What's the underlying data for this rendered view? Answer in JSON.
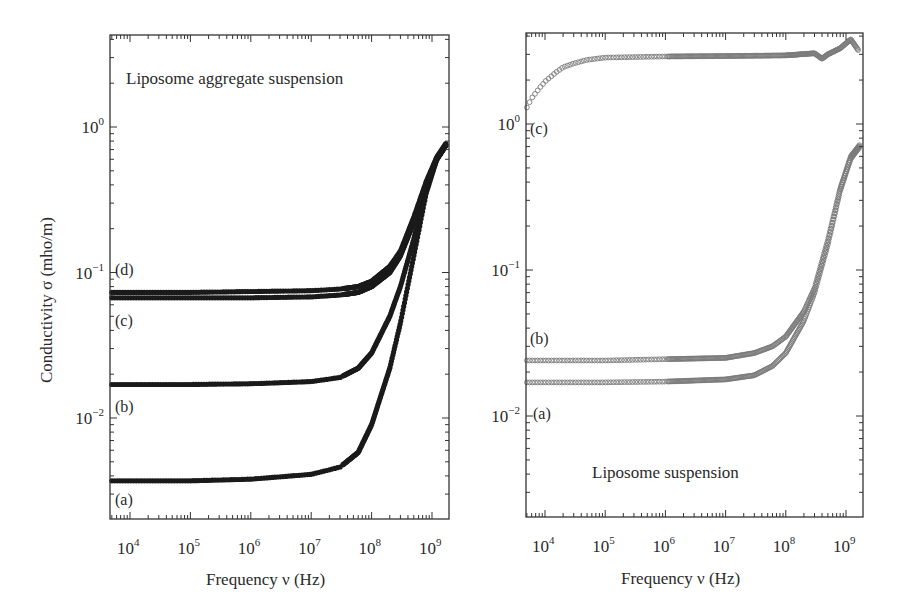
{
  "chart_data": [
    {
      "type": "scatter",
      "panel": "left",
      "title": "Liposome aggregate suspension",
      "xlabel": "Frequency ν (Hz)",
      "ylabel": "Conductivity σ (mho/m)",
      "xscale": "log",
      "yscale": "log",
      "xlim": [
        4700,
        1900000000
      ],
      "ylim": [
        0.002,
        4.3
      ],
      "xticks": [
        10000,
        100000,
        1000000,
        10000000,
        100000000,
        1000000000
      ],
      "xtick_labels": [
        "10^4",
        "10^5",
        "10^6",
        "10^7",
        "10^8",
        "10^9"
      ],
      "yticks": [
        0.01,
        0.1,
        1
      ],
      "ytick_labels": [
        "10^-2",
        "10^-1",
        "10^0"
      ],
      "grid": false,
      "marker": "filled circle",
      "series": [
        {
          "name": "(a)",
          "x": [
            5000,
            10000,
            100000,
            1000000,
            10000000,
            30000000,
            60000000,
            100000000,
            200000000,
            300000000,
            500000000,
            800000000,
            1200000000,
            1700000000
          ],
          "y": [
            0.0037,
            0.0037,
            0.0037,
            0.0038,
            0.0041,
            0.0046,
            0.0058,
            0.009,
            0.022,
            0.045,
            0.13,
            0.35,
            0.6,
            0.75
          ]
        },
        {
          "name": "(b)",
          "x": [
            5000,
            10000,
            100000,
            1000000,
            10000000,
            30000000,
            60000000,
            100000000,
            200000000,
            300000000,
            500000000,
            800000000,
            1200000000,
            1700000000
          ],
          "y": [
            0.017,
            0.017,
            0.017,
            0.0172,
            0.0178,
            0.019,
            0.022,
            0.028,
            0.05,
            0.08,
            0.17,
            0.38,
            0.6,
            0.75
          ]
        },
        {
          "name": "(c)",
          "x": [
            5000,
            10000,
            100000,
            1000000,
            10000000,
            30000000,
            60000000,
            100000000,
            200000000,
            300000000,
            500000000,
            800000000,
            1200000000,
            1700000000
          ],
          "y": [
            0.067,
            0.067,
            0.067,
            0.067,
            0.068,
            0.07,
            0.073,
            0.08,
            0.1,
            0.13,
            0.22,
            0.4,
            0.6,
            0.75
          ]
        },
        {
          "name": "(d)",
          "x": [
            5000,
            10000,
            100000,
            1000000,
            10000000,
            30000000,
            60000000,
            100000000,
            200000000,
            300000000,
            500000000,
            800000000,
            1200000000,
            1700000000
          ],
          "y": [
            0.073,
            0.073,
            0.073,
            0.074,
            0.075,
            0.077,
            0.08,
            0.087,
            0.11,
            0.14,
            0.24,
            0.42,
            0.62,
            0.77
          ]
        }
      ],
      "annotations": [
        "(a)",
        "(b)",
        "(c)",
        "(d)"
      ]
    },
    {
      "type": "scatter",
      "panel": "right",
      "title": "Liposome suspension",
      "xlabel": "Frequency ν (Hz)",
      "ylabel": "",
      "xscale": "log",
      "yscale": "log",
      "xlim": [
        4700,
        1900000000
      ],
      "ylim": [
        0.002,
        4.3
      ],
      "xticks": [
        10000,
        100000,
        1000000,
        10000000,
        100000000,
        1000000000
      ],
      "xtick_labels": [
        "10^4",
        "10^5",
        "10^6",
        "10^7",
        "10^8",
        "10^9"
      ],
      "yticks": [
        0.01,
        0.1,
        1
      ],
      "ytick_labels": [
        "10^-2",
        "10^-1",
        "10^0"
      ],
      "grid": false,
      "marker": "open circle",
      "series": [
        {
          "name": "(a)",
          "x": [
            5000,
            10000,
            100000,
            1000000,
            10000000,
            30000000,
            60000000,
            100000000,
            200000000,
            300000000,
            500000000,
            800000000,
            1200000000,
            1700000000
          ],
          "y": [
            0.017,
            0.017,
            0.017,
            0.0172,
            0.0178,
            0.019,
            0.022,
            0.027,
            0.045,
            0.07,
            0.15,
            0.35,
            0.58,
            0.7
          ]
        },
        {
          "name": "(b)",
          "x": [
            5000,
            10000,
            100000,
            1000000,
            10000000,
            30000000,
            60000000,
            100000000,
            200000000,
            300000000,
            500000000,
            800000000,
            1200000000,
            1700000000
          ],
          "y": [
            0.024,
            0.024,
            0.024,
            0.0245,
            0.025,
            0.027,
            0.03,
            0.035,
            0.052,
            0.075,
            0.16,
            0.36,
            0.6,
            0.72
          ]
        },
        {
          "name": "(c)",
          "x": [
            5000,
            6000,
            8000,
            10000,
            15000,
            20000,
            30000,
            50000,
            100000,
            1000000,
            10000000,
            100000000,
            300000000,
            400000000,
            500000000,
            800000000,
            1200000000,
            1600000000
          ],
          "y": [
            1.3,
            1.5,
            1.75,
            1.95,
            2.25,
            2.45,
            2.6,
            2.75,
            2.85,
            2.9,
            2.92,
            2.95,
            3.05,
            2.8,
            3.0,
            3.3,
            3.8,
            3.2
          ]
        }
      ],
      "annotations": [
        "(a)",
        "(b)",
        "(c)"
      ]
    }
  ],
  "left_panel": {
    "title": "Liposome aggregate suspension",
    "ylabel": "Conductivity σ (mho/m)",
    "xlabel": "Frequency ν (Hz)",
    "labels": {
      "a": "(a)",
      "b": "(b)",
      "c": "(c)",
      "d": "(d)"
    }
  },
  "right_panel": {
    "title": "Liposome suspension",
    "xlabel": "Frequency ν (Hz)",
    "labels": {
      "a": "(a)",
      "b": "(b)",
      "c": "(c)"
    }
  },
  "ticks": {
    "x": [
      {
        "base": "10",
        "exp": "4"
      },
      {
        "base": "10",
        "exp": "5"
      },
      {
        "base": "10",
        "exp": "6"
      },
      {
        "base": "10",
        "exp": "7"
      },
      {
        "base": "10",
        "exp": "8"
      },
      {
        "base": "10",
        "exp": "9"
      }
    ],
    "y": [
      {
        "base": "10",
        "exp": "0"
      },
      {
        "base": "10",
        "exp": "−1"
      },
      {
        "base": "10",
        "exp": "−2"
      }
    ]
  },
  "colors": {
    "axis": "#333333",
    "filled_marker": "#1a1a1a",
    "open_marker": "#7a7a7a",
    "text": "#2a2a2a"
  }
}
